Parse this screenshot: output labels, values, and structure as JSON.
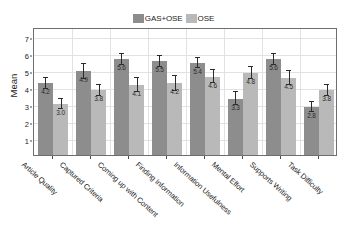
{
  "chart_data": {
    "type": "bar",
    "title": "",
    "xlabel": "",
    "ylabel": "Mean",
    "ylim": [
      0,
      7.5
    ],
    "yticks": [
      1,
      2,
      3,
      4,
      5,
      6,
      7
    ],
    "grid": true,
    "legend_position": "top-center",
    "categories": [
      "Article Quality",
      "Captured Criteria",
      "Coming up with Content",
      "Finding Information",
      "Information Usefulness",
      "Mental Effort",
      "Supports Writing",
      "Task Difficulty"
    ],
    "series": [
      {
        "name": "GAS+OSE",
        "color": "#8d8d8d",
        "values": [
          4.2,
          4.9,
          5.6,
          5.5,
          5.4,
          3.3,
          5.6,
          2.8
        ],
        "errors": [
          0.32,
          0.42,
          0.3,
          0.33,
          0.3,
          0.38,
          0.32,
          0.3
        ]
      },
      {
        "name": "OSE",
        "color": "#b9b9b9",
        "values": [
          3.0,
          3.8,
          4.1,
          4.2,
          4.6,
          4.8,
          4.5,
          3.8
        ],
        "errors": [
          0.28,
          0.32,
          0.4,
          0.42,
          0.36,
          0.33,
          0.4,
          0.33
        ]
      }
    ]
  },
  "legend": {
    "entries": [
      {
        "label": "GAS+OSE",
        "color": "#8d8d8d"
      },
      {
        "label": "OSE",
        "color": "#b9b9b9"
      }
    ]
  },
  "axes": {
    "y_title": "Mean",
    "y_tick_labels": [
      "7",
      "6",
      "5",
      "4",
      "3",
      "2",
      "1"
    ]
  }
}
